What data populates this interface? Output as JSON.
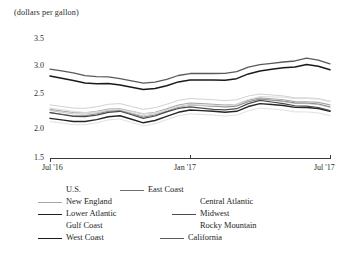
{
  "chart_data": {
    "type": "line",
    "title": "",
    "ylabel": "(dollars per gallon)",
    "xlabel": "",
    "ylim": [
      1.5,
      3.5
    ],
    "yticks": [
      1.5,
      2.0,
      2.5,
      3.0,
      3.5
    ],
    "ytick_labels": [
      "1.5",
      "2.0",
      "2.5",
      "3.0",
      "3.5"
    ],
    "xticks": [
      "Jul '16",
      "Jan '17",
      "Jul '17"
    ],
    "xtick_labels": [
      "Jul '16",
      "Jan '17",
      "Jul '17"
    ],
    "grid": false,
    "legend_position": "below",
    "x": [
      "Jul '16",
      "Aug '16",
      "Sep '16",
      "Oct '16",
      "Nov '16",
      "Dec '16",
      "Jan '17",
      "Feb '17",
      "Mar '17",
      "Apr '17",
      "May '17",
      "Jun '17",
      "Jul '17"
    ],
    "series": [
      {
        "name": "U.S.",
        "color": "#c9c9c9",
        "width": 1.0,
        "values": [
          2.24,
          2.19,
          2.21,
          2.25,
          2.16,
          2.25,
          2.33,
          2.31,
          2.32,
          2.42,
          2.38,
          2.35,
          2.29
        ]
      },
      {
        "name": "East Coast",
        "color": "#8a8a8a",
        "width": 1.0,
        "values": [
          2.21,
          2.16,
          2.19,
          2.24,
          2.14,
          2.23,
          2.33,
          2.31,
          2.31,
          2.42,
          2.39,
          2.36,
          2.3
        ]
      },
      {
        "name": "New England",
        "color": "#a8a8a8",
        "width": 1.1,
        "values": [
          2.26,
          2.21,
          2.23,
          2.27,
          2.19,
          2.27,
          2.36,
          2.34,
          2.34,
          2.44,
          2.41,
          2.38,
          2.33
        ]
      },
      {
        "name": "Central Atlantic",
        "color": "#d2d2d2",
        "width": 1.0,
        "values": [
          2.33,
          2.28,
          2.3,
          2.35,
          2.26,
          2.34,
          2.43,
          2.41,
          2.41,
          2.5,
          2.47,
          2.44,
          2.39
        ]
      },
      {
        "name": "Lower Atlantic",
        "color": "#262626",
        "width": 1.4,
        "values": [
          2.12,
          2.07,
          2.1,
          2.16,
          2.05,
          2.15,
          2.25,
          2.23,
          2.23,
          2.35,
          2.32,
          2.29,
          2.23
        ]
      },
      {
        "name": "Midwest",
        "color": "#4a4a4a",
        "width": 1.2,
        "values": [
          2.21,
          2.15,
          2.17,
          2.23,
          2.12,
          2.22,
          2.3,
          2.26,
          2.27,
          2.4,
          2.35,
          2.31,
          2.24
        ]
      },
      {
        "name": "Gulf Coast",
        "color": "#e0e0e0",
        "width": 1.0,
        "values": [
          2.07,
          2.02,
          2.05,
          2.11,
          2.0,
          2.1,
          2.19,
          2.17,
          2.17,
          2.28,
          2.25,
          2.22,
          2.16
        ]
      },
      {
        "name": "Rocky Mountain",
        "color": "#dcdcdc",
        "width": 1.0,
        "values": [
          2.28,
          2.23,
          2.22,
          2.26,
          2.19,
          2.25,
          2.33,
          2.32,
          2.34,
          2.46,
          2.45,
          2.43,
          2.38
        ]
      },
      {
        "name": "West Coast",
        "color": "#1a1a1a",
        "width": 1.5,
        "values": [
          2.78,
          2.71,
          2.66,
          2.64,
          2.57,
          2.63,
          2.72,
          2.72,
          2.74,
          2.86,
          2.91,
          2.96,
          2.88
        ]
      },
      {
        "name": "California",
        "color": "#5a5a5a",
        "width": 1.3,
        "values": [
          2.89,
          2.83,
          2.77,
          2.74,
          2.67,
          2.73,
          2.82,
          2.82,
          2.85,
          2.96,
          3.0,
          3.06,
          2.97
        ]
      }
    ]
  },
  "legend": {
    "column1": [
      {
        "label": "U.S.",
        "color": "#c9c9c9",
        "width": 1.0,
        "swatch": true
      },
      {
        "label": "New England",
        "color": "#a8a8a8",
        "width": 1.1,
        "swatch": true
      },
      {
        "label": "Lower Atlantic",
        "color": "#1f1f1f",
        "width": 1.6,
        "swatch": true
      },
      {
        "label": "Gulf Coast",
        "color": "#efefef",
        "width": 1.0,
        "swatch": false
      },
      {
        "label": "West Coast",
        "color": "#1a1a1a",
        "width": 1.7,
        "swatch": true
      }
    ],
    "column2": [
      {
        "label": "East Coast",
        "color": "#6e6e6e",
        "width": 1.3,
        "swatch": true
      },
      {
        "label": "Central Atlantic",
        "color": "#efefef",
        "width": 1.0,
        "swatch": false
      },
      {
        "label": "Midwest",
        "color": "#4a4a4a",
        "width": 1.3,
        "swatch": true
      },
      {
        "label": "Rocky Mountain",
        "color": "#efefef",
        "width": 1.0,
        "swatch": false
      },
      {
        "label": "California",
        "color": "#5a5a5a",
        "width": 1.4,
        "swatch": true
      }
    ]
  }
}
